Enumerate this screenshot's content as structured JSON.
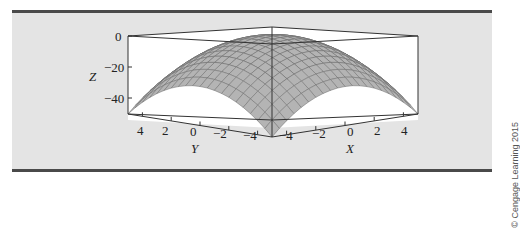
{
  "figure": {
    "credit": "© Cengage Learning 2015",
    "colors": {
      "panel_background": "#e4e4e4",
      "rule": "#4a4a4a",
      "surface_fill": "#b4b4b4",
      "mesh_line": "#6a6a6a",
      "box_line": "#333333",
      "plot_background": "#ffffff"
    }
  },
  "axes": {
    "z": {
      "title": "Z",
      "ticks": [
        "0",
        "−20",
        "−40"
      ]
    },
    "y": {
      "title": "Y",
      "ticks": [
        "4",
        "2",
        "0",
        "−2",
        "−4"
      ]
    },
    "x": {
      "title": "X",
      "ticks": [
        "−4",
        "−2",
        "0",
        "2",
        "4"
      ]
    }
  },
  "chart_data": {
    "type": "surface3d",
    "title": "",
    "function": "z = -(x^2 + y^2)",
    "x": [
      -5,
      -4,
      -3,
      -2,
      -1,
      0,
      1,
      2,
      3,
      4,
      5
    ],
    "y": [
      -5,
      -4,
      -3,
      -2,
      -1,
      0,
      1,
      2,
      3,
      4,
      5
    ],
    "z_at_origin": 0,
    "z_at_corners": -50,
    "xlabel": "X",
    "ylabel": "Y",
    "zlabel": "Z",
    "xlim": [
      -5,
      5
    ],
    "ylim": [
      -5,
      5
    ],
    "zlim": [
      -50,
      0
    ],
    "x_ticks": [
      -4,
      -2,
      0,
      2,
      4
    ],
    "y_ticks": [
      4,
      2,
      0,
      -2,
      -4
    ],
    "z_ticks": [
      0,
      -20,
      -40
    ],
    "grid": false,
    "legend": null
  }
}
